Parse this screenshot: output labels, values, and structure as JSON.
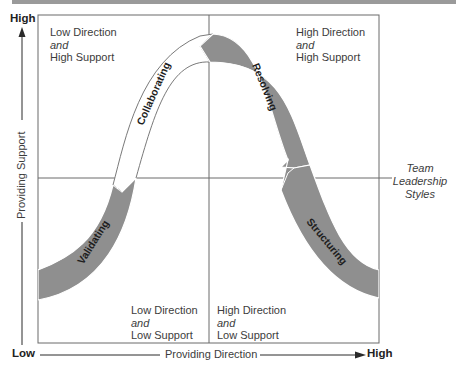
{
  "diagram": {
    "title_bar_color": "#9a9a9a",
    "axes": {
      "y_high": "High",
      "y_low": "Low",
      "y_label": "Providing Support",
      "x_high": "High",
      "x_label": "Providing Direction"
    },
    "quadrants": {
      "top_left": {
        "line1": "Low Direction",
        "line2": "and",
        "line3": "High Support"
      },
      "top_right": {
        "line1": "High Direction",
        "line2": "and",
        "line3": "High Support"
      },
      "bottom_left": {
        "line1": "Low Direction",
        "line2": "and",
        "line3": "Low Support"
      },
      "bottom_right": {
        "line1": "High Direction",
        "line2": "and",
        "line3": "Low Support"
      }
    },
    "side_label": {
      "line1": "Team",
      "line2": "Leadership",
      "line3": "Styles"
    },
    "styles": [
      {
        "name": "Validating",
        "quadrant": "bottom-left",
        "fill": "#8f8f8f"
      },
      {
        "name": "Collaborating",
        "quadrant": "top-left",
        "fill": "#ffffff"
      },
      {
        "name": "Resolving",
        "quadrant": "top-right",
        "fill": "#8f8f8f"
      },
      {
        "name": "Structuring",
        "quadrant": "bottom-right",
        "fill": "#8f8f8f"
      }
    ]
  }
}
